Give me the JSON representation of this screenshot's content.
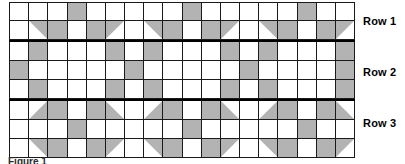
{
  "figure": {
    "caption": "Figure 1",
    "columns": 18,
    "colors": {
      "fill": "#b3b3b3",
      "background": "#ffffff",
      "gridline": "#1a1a1a",
      "band_divider": "#000000",
      "label_text": "#000000"
    }
  },
  "row_labels": [
    {
      "id": "row-1",
      "text": "Row 1"
    },
    {
      "id": "row-2",
      "text": "Row 2"
    },
    {
      "id": "row-3",
      "text": "Row 3"
    }
  ],
  "chart_data": {
    "type": "heatmap",
    "title": "Figure 1",
    "xlabel": "",
    "ylabel": "",
    "columns": 18,
    "rows": 8,
    "legend": [
      {
        "key": "empty",
        "label": "white cell"
      },
      {
        "key": "full",
        "label": "shaded square"
      },
      {
        "key": "tl",
        "label": "shaded top-left triangle"
      },
      {
        "key": "tr",
        "label": "shaded top-right triangle"
      },
      {
        "key": "bl",
        "label": "shaded bottom-left triangle"
      },
      {
        "key": "br",
        "label": "shaded bottom-right triangle"
      }
    ],
    "bands": [
      {
        "label": "Row 1",
        "subrows": [
          [
            "empty",
            "empty",
            "empty",
            "full",
            "empty",
            "empty",
            "empty",
            "empty",
            "empty",
            "full",
            "empty",
            "empty",
            "empty",
            "empty",
            "empty",
            "full",
            "empty",
            "empty"
          ],
          [
            "empty",
            "tr",
            "full",
            "empty",
            "full",
            "tl",
            "empty",
            "tr",
            "full",
            "empty",
            "full",
            "tl",
            "empty",
            "tr",
            "full",
            "empty",
            "full",
            "tl"
          ]
        ]
      },
      {
        "label": "Row 2",
        "subrows": [
          [
            "empty",
            "full",
            "empty",
            "empty",
            "empty",
            "full",
            "empty",
            "full",
            "empty",
            "empty",
            "empty",
            "full",
            "empty",
            "full",
            "empty",
            "empty",
            "empty",
            "full"
          ],
          [
            "full",
            "empty",
            "empty",
            "empty",
            "empty",
            "empty",
            "full",
            "empty",
            "empty",
            "empty",
            "empty",
            "empty",
            "full",
            "empty",
            "empty",
            "empty",
            "empty",
            "full"
          ],
          [
            "empty",
            "full",
            "empty",
            "empty",
            "empty",
            "full",
            "empty",
            "full",
            "empty",
            "empty",
            "empty",
            "full",
            "empty",
            "full",
            "empty",
            "empty",
            "empty",
            "full"
          ]
        ]
      },
      {
        "label": "Row 3",
        "subrows": [
          [
            "empty",
            "br",
            "full",
            "empty",
            "full",
            "bl",
            "empty",
            "br",
            "full",
            "empty",
            "full",
            "bl",
            "empty",
            "br",
            "full",
            "empty",
            "full",
            "bl"
          ],
          [
            "empty",
            "empty",
            "empty",
            "full",
            "empty",
            "empty",
            "empty",
            "empty",
            "empty",
            "full",
            "empty",
            "empty",
            "empty",
            "empty",
            "empty",
            "full",
            "empty",
            "empty"
          ],
          [
            "empty",
            "tr",
            "full",
            "empty",
            "full",
            "tl",
            "empty",
            "tr",
            "full",
            "empty",
            "full",
            "tl",
            "empty",
            "tr",
            "full",
            "empty",
            "full",
            "tl"
          ]
        ]
      }
    ]
  }
}
